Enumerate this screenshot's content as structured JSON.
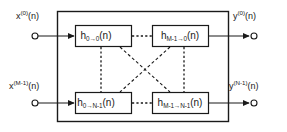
{
  "figure": {
    "background_color": "#ffffff",
    "line_color": "#1a1a1a"
  },
  "inputs": [
    {
      "id": "in-0",
      "label_main": "x",
      "label_sup": "(0)",
      "label_tail": "(n)",
      "terminal": "open-circle",
      "arrow": "filled-arrow"
    },
    {
      "id": "in-m1",
      "label_main": "x",
      "label_sup": "(M-1)",
      "label_tail": "(n)",
      "terminal": "open-circle",
      "arrow": "filled-arrow"
    }
  ],
  "outputs": [
    {
      "id": "out-0",
      "label_main": "y",
      "label_sup": "(0)",
      "label_tail": "(n)",
      "terminal": "open-circle",
      "arrow": "filled-arrow"
    },
    {
      "id": "out-n1",
      "label_main": "y",
      "label_sup": "(N-1)",
      "label_tail": "(n)",
      "terminal": "open-circle",
      "arrow": "filled-arrow"
    }
  ],
  "blocks": [
    {
      "id": "h-0-0",
      "position": "top-left",
      "h": "h",
      "sub": "0→0",
      "tail": "(n)"
    },
    {
      "id": "h-m1-0",
      "position": "top-right",
      "h": "h",
      "sub": "M-1→0",
      "tail": "(n)"
    },
    {
      "id": "h-0-n1",
      "position": "bottom-left",
      "h": "h",
      "sub": "0→N-1",
      "tail": "(n)"
    },
    {
      "id": "h-m1-n1",
      "position": "bottom-right",
      "h": "h",
      "sub": "M-1→N-1",
      "tail": "(n)"
    }
  ],
  "connections": [
    {
      "id": "conn-top-horizontal",
      "from": "h-0-0",
      "to": "h-m1-0",
      "style": "dashed"
    },
    {
      "id": "conn-bottom-horizontal",
      "from": "h-0-n1",
      "to": "h-m1-n1",
      "style": "dashed"
    },
    {
      "id": "conn-left-vertical",
      "from": "h-0-0",
      "to": "h-0-n1",
      "style": "dashed"
    },
    {
      "id": "conn-right-vertical",
      "from": "h-m1-0",
      "to": "h-m1-n1",
      "style": "dashed"
    },
    {
      "id": "conn-diagonal-1",
      "from": "h-0-0",
      "to": "h-m1-n1",
      "style": "dashed"
    },
    {
      "id": "conn-diagonal-2",
      "from": "h-m1-0",
      "to": "h-0-n1",
      "style": "dashed"
    }
  ],
  "frame": {
    "id": "system-boundary",
    "shape": "rectangle"
  }
}
